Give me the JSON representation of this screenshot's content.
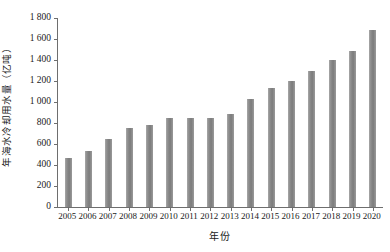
{
  "chart_data": {
    "type": "bar",
    "title": "",
    "subtitle": "",
    "xlabel": "年份",
    "ylabel": "年海水冷却用水量（亿吨）",
    "categories": [
      "2005",
      "2006",
      "2007",
      "2008",
      "2009",
      "2010",
      "2011",
      "2012",
      "2013",
      "2014",
      "2015",
      "2016",
      "2017",
      "2018",
      "2019",
      "2020"
    ],
    "values": [
      470,
      530,
      650,
      750,
      780,
      850,
      850,
      850,
      890,
      1030,
      1130,
      1200,
      1300,
      1400,
      1490,
      1690
    ],
    "series": [
      {
        "name": "年海水冷却用水量",
        "values": [
          470,
          530,
          650,
          750,
          780,
          850,
          850,
          850,
          890,
          1030,
          1130,
          1200,
          1300,
          1400,
          1490,
          1690
        ]
      }
    ],
    "ylim": [
      0,
      1800
    ],
    "ytick_labels": [
      "0",
      "200",
      "400",
      "600",
      "800",
      "1 000",
      "1 200",
      "1 400",
      "1 600",
      "1 800"
    ],
    "ytick_values": [
      0,
      200,
      400,
      600,
      800,
      1000,
      1200,
      1400,
      1600,
      1800
    ],
    "grid": false,
    "legend": false,
    "legend_position": "none",
    "bar_color": "#858585",
    "axis_color": "#6e6e6e",
    "background_color": "#ffffff",
    "annotations": []
  }
}
